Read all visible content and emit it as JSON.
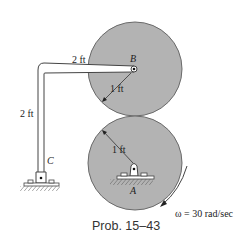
{
  "figure": {
    "caption": "Prob. 15–43",
    "colors": {
      "disk_fill": "#b3b3b3",
      "disk_stroke": "#6a6a6a",
      "line": "#444444",
      "background": "#ffffff"
    }
  },
  "labels": {
    "bar_horizontal_length": "2 ft",
    "bar_vertical_length": "2 ft",
    "upper_disk_radius": "1 ft",
    "lower_disk_radius": "1 ft",
    "point_B": "B",
    "point_A": "A",
    "point_C": "C",
    "angular_velocity": "ω = 30 rad/sec"
  }
}
